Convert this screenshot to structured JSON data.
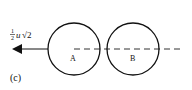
{
  "diagram": {
    "panel_label": "(c)",
    "velocity_label": {
      "fraction_num": "1",
      "fraction_den": "2",
      "symbol": "u",
      "radical": "√2",
      "full": "½u√2"
    },
    "balls": [
      {
        "label": "A",
        "cx": 74,
        "cy": 49,
        "r": 26
      },
      {
        "label": "B",
        "cx": 133,
        "cy": 49,
        "r": 26
      }
    ],
    "line_of_centres": {
      "style": "dashed",
      "y": 49
    },
    "arrow": {
      "direction": "left",
      "from_x": 48,
      "to_x": 12,
      "y": 49
    },
    "colors": {
      "stroke": "#111111",
      "background": "#ffffff"
    }
  }
}
